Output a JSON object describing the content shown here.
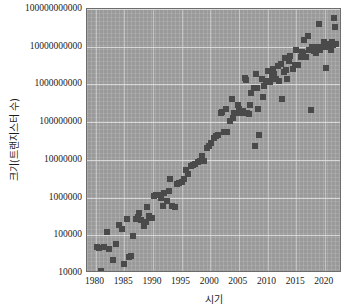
{
  "chart_data": {
    "type": "scatter",
    "title": "",
    "xlabel": "시기",
    "ylabel": "크기(트랜지스터 수)",
    "xlim": [
      1978.5,
      2023.0
    ],
    "ylim_log10": [
      4,
      11
    ],
    "yscale": "log",
    "grid": true,
    "legend": null,
    "marker": {
      "shape": "square",
      "color": "#4a4a4a",
      "size_px": 6
    },
    "plot_background": "#9a9a9a",
    "xticks": [
      1980,
      1985,
      1990,
      1995,
      2000,
      2005,
      2010,
      2015,
      2020
    ],
    "xtick_labels": [
      "1980",
      "1985",
      "1990",
      "1995",
      "2000",
      "2005",
      "2010",
      "2015",
      "2020"
    ],
    "yticks": [
      10000,
      100000,
      1000000,
      10000000,
      100000000,
      1000000000,
      10000000000,
      100000000000
    ],
    "ytick_labels": [
      "10000",
      "100000",
      "1000000",
      "10000000",
      "100000000",
      "1000000000",
      "10000000000",
      "100000000000"
    ],
    "points": [
      [
        1980.2,
        48000
      ],
      [
        1980.6,
        45000
      ],
      [
        1981.0,
        11000
      ],
      [
        1981.4,
        50000
      ],
      [
        1982.0,
        120000
      ],
      [
        1982.4,
        44000
      ],
      [
        1983.0,
        22000
      ],
      [
        1983.6,
        60000
      ],
      [
        1984.0,
        190000
      ],
      [
        1984.6,
        145000
      ],
      [
        1985.0,
        17000
      ],
      [
        1985.4,
        275000
      ],
      [
        1985.8,
        27000
      ],
      [
        1986.2,
        28000
      ],
      [
        1986.6,
        95000
      ],
      [
        1987.0,
        275000
      ],
      [
        1987.4,
        310000
      ],
      [
        1987.6,
        400000
      ],
      [
        1988.0,
        250000
      ],
      [
        1988.4,
        180000
      ],
      [
        1988.8,
        230000
      ],
      [
        1989.0,
        560000
      ],
      [
        1989.4,
        320000
      ],
      [
        1989.8,
        290000
      ],
      [
        1990.2,
        1100000
      ],
      [
        1990.6,
        1180000
      ],
      [
        1991.0,
        1200000
      ],
      [
        1991.4,
        1000000
      ],
      [
        1991.8,
        600000
      ],
      [
        1992.0,
        1350000
      ],
      [
        1992.4,
        820000
      ],
      [
        1992.8,
        1450000
      ],
      [
        1993.0,
        3100000
      ],
      [
        1993.4,
        590000
      ],
      [
        1993.8,
        560000
      ],
      [
        1994.2,
        2300000
      ],
      [
        1994.6,
        2400000
      ],
      [
        1995.0,
        2600000
      ],
      [
        1995.4,
        3200000
      ],
      [
        1995.8,
        5500000
      ],
      [
        1996.2,
        4300000
      ],
      [
        1996.6,
        6800000
      ],
      [
        1997.0,
        7500000
      ],
      [
        1997.4,
        7800000
      ],
      [
        1997.8,
        8800000
      ],
      [
        1998.2,
        9300000
      ],
      [
        1998.6,
        13000000
      ],
      [
        1999.0,
        9500000
      ],
      [
        1999.4,
        21000000
      ],
      [
        1999.8,
        24000000
      ],
      [
        2000.2,
        28000000
      ],
      [
        2000.6,
        37000000
      ],
      [
        2001.0,
        42000000
      ],
      [
        2001.4,
        45000000
      ],
      [
        2001.8,
        180000000
      ],
      [
        2002.0,
        190000000
      ],
      [
        2002.4,
        55000000
      ],
      [
        2002.8,
        220000000
      ],
      [
        2003.0,
        54000000
      ],
      [
        2003.4,
        105000000
      ],
      [
        2003.8,
        410000000
      ],
      [
        2004.0,
        125000000
      ],
      [
        2004.4,
        170000000
      ],
      [
        2004.8,
        290000000
      ],
      [
        2005.0,
        230000000
      ],
      [
        2005.4,
        175000000
      ],
      [
        2005.8,
        200000000
      ],
      [
        2006.0,
        1500000000
      ],
      [
        2006.4,
        180000000
      ],
      [
        2006.8,
        160000000
      ],
      [
        2007.0,
        290000000
      ],
      [
        2007.2,
        600000000
      ],
      [
        2007.6,
        820000000
      ],
      [
        2007.8,
        24000000
      ],
      [
        2008.0,
        1900000000
      ],
      [
        2008.2,
        800000000
      ],
      [
        2008.4,
        220000000
      ],
      [
        2008.6,
        45000000
      ],
      [
        2009.0,
        1400000000
      ],
      [
        2009.4,
        900000000
      ],
      [
        2009.8,
        1200000000
      ],
      [
        2010.0,
        2300000000
      ],
      [
        2010.4,
        1170000000
      ],
      [
        2010.8,
        1700000000
      ],
      [
        2011.0,
        2600000000
      ],
      [
        2011.4,
        1400000000
      ],
      [
        2011.8,
        3100000000
      ],
      [
        2012.0,
        1200000000
      ],
      [
        2012.4,
        3500000000
      ],
      [
        2012.6,
        400000000
      ],
      [
        2012.8,
        2100000000
      ],
      [
        2013.0,
        5000000000
      ],
      [
        2013.4,
        1400000000
      ],
      [
        2013.8,
        4300000000
      ],
      [
        2014.0,
        5700000000
      ],
      [
        2014.4,
        2600000000
      ],
      [
        2014.8,
        3200000000
      ],
      [
        2015.0,
        8000000000
      ],
      [
        2015.4,
        3300000000
      ],
      [
        2015.8,
        5500000000
      ],
      [
        2016.0,
        7200000000
      ],
      [
        2016.4,
        15000000000
      ],
      [
        2016.8,
        5400000000
      ],
      [
        2017.0,
        19200000000
      ],
      [
        2017.2,
        8000000000
      ],
      [
        2017.6,
        210000000
      ],
      [
        2017.8,
        9700000000
      ],
      [
        2018.0,
        9000000000
      ],
      [
        2018.4,
        6900000000
      ],
      [
        2018.8,
        10000000000
      ],
      [
        2019.0,
        39000000000
      ],
      [
        2019.2,
        8000000000
      ],
      [
        2019.6,
        10000000000
      ],
      [
        2019.8,
        13000000000
      ],
      [
        2020.0,
        9800000000
      ],
      [
        2020.2,
        2700000000
      ],
      [
        2020.6,
        10000000000
      ],
      [
        2020.8,
        12000000000
      ],
      [
        2021.0,
        8000000000
      ],
      [
        2021.2,
        13000000000
      ],
      [
        2021.4,
        11000000000
      ],
      [
        2021.6,
        57000000000
      ],
      [
        2021.8,
        33000000000
      ],
      [
        2022.0,
        12000000000
      ],
      [
        2009.2,
        470000000
      ],
      [
        2004.2,
        180000000
      ],
      [
        2006.2,
        1300000000
      ],
      [
        2013.2,
        2400000000
      ],
      [
        2016.2,
        7000000000
      ],
      [
        2020.4,
        10000000000
      ],
      [
        2018.2,
        7600000000
      ],
      [
        2011.2,
        1900000000
      ]
    ]
  }
}
